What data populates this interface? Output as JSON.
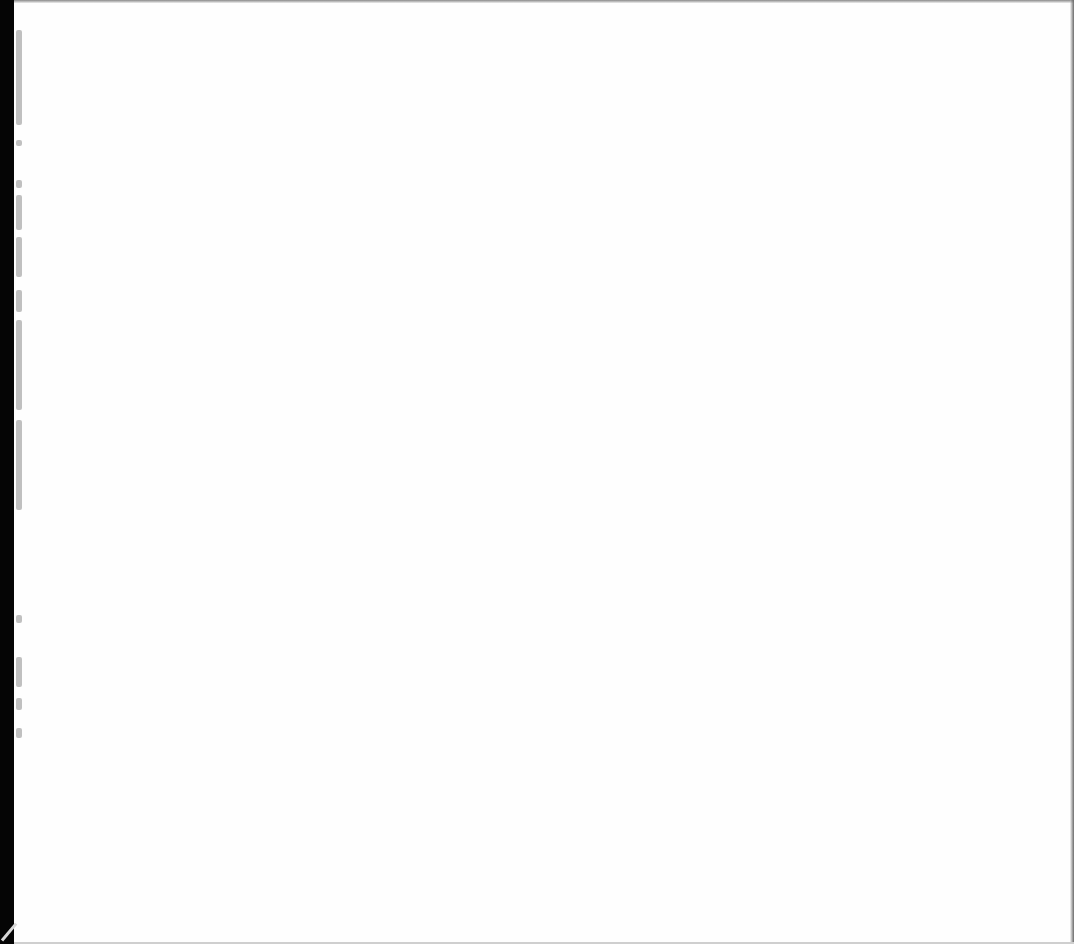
{
  "page": {
    "type": "scanned-blank-page",
    "text": "",
    "colors": {
      "paper": "#fefefe",
      "margin_strip": "#050505",
      "bleed_marks": "#b5b5b5"
    },
    "bleed_marks": [
      {
        "top": 30,
        "height": 95
      },
      {
        "top": 140,
        "height": 6
      },
      {
        "top": 180,
        "height": 8
      },
      {
        "top": 195,
        "height": 35
      },
      {
        "top": 237,
        "height": 40
      },
      {
        "top": 290,
        "height": 22
      },
      {
        "top": 320,
        "height": 90
      },
      {
        "top": 420,
        "height": 90
      },
      {
        "top": 615,
        "height": 8
      },
      {
        "top": 657,
        "height": 30
      },
      {
        "top": 698,
        "height": 12
      },
      {
        "top": 728,
        "height": 10
      }
    ]
  }
}
